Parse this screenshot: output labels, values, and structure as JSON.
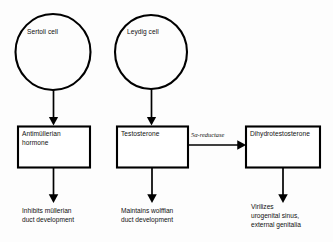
{
  "diagram": {
    "colors": {
      "stroke": "#000000",
      "background": "#fdfdfd",
      "text": "#111111"
    },
    "cells": [
      {
        "id": "sertoli",
        "label": "Sertoli cell",
        "shape": "circle"
      },
      {
        "id": "leydig",
        "label": "Leydig cell",
        "shape": "circle"
      }
    ],
    "boxes": [
      {
        "id": "amh",
        "label": "Antimüllerian\nhormone",
        "shape": "rectangle"
      },
      {
        "id": "testosterone",
        "label": "Testosterone",
        "shape": "rectangle"
      },
      {
        "id": "dht",
        "label": "Dihydrotestosterone",
        "shape": "rectangle"
      }
    ],
    "enzyme": {
      "id": "5a-reductase",
      "label": "5α-reductase"
    },
    "outcomes": [
      {
        "id": "mullerian",
        "label": "Inhibits müllerian\nduct development"
      },
      {
        "id": "wolffian",
        "label": "Maintains wolffian\nduct development"
      },
      {
        "id": "virilization",
        "label": "Virilizes\nurogenital sinus,\nexternal genitalia"
      }
    ],
    "arrows": [
      {
        "id": "sertoli-to-amh",
        "direction": "down"
      },
      {
        "id": "leydig-to-testosterone",
        "direction": "down"
      },
      {
        "id": "amh-to-mullerian",
        "direction": "down"
      },
      {
        "id": "testosterone-to-wolffian",
        "direction": "down"
      },
      {
        "id": "testosterone-to-dht",
        "direction": "right"
      },
      {
        "id": "dht-to-virilization",
        "direction": "down"
      }
    ]
  }
}
